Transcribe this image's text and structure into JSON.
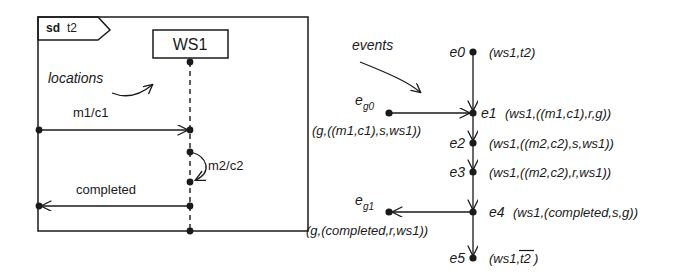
{
  "figure": {
    "left_panel": {
      "frame_kind": "sd",
      "frame_name": "t2",
      "lifeline_name": "WS1",
      "annotation": "locations",
      "messages": [
        {
          "label": "m1/c1",
          "kind": "incoming-arrow"
        },
        {
          "label": "m2/c2",
          "kind": "self-arrow"
        },
        {
          "label": "completed",
          "kind": "outgoing-arrow"
        }
      ]
    },
    "right_panel": {
      "annotation": "events",
      "events": [
        {
          "id": "e0",
          "sub": "",
          "value": "(ws1,t2)",
          "overline": ""
        },
        {
          "id": "e1",
          "sub": "",
          "value": "(ws1,((m1,c1),r,g))",
          "overline": ""
        },
        {
          "id": "e2",
          "sub": "",
          "value": "(ws1,((m2,c2),s,ws1))",
          "overline": ""
        },
        {
          "id": "e3",
          "sub": "",
          "value": "(ws1,((m2,c2),r,ws1))",
          "overline": ""
        },
        {
          "id": "e4",
          "sub": "",
          "value": "(ws1,(completed,s,g))",
          "overline": ""
        },
        {
          "id": "e5",
          "sub": "",
          "value_prefix": "(ws1,",
          "overline": "t2",
          "value_suffix": ")",
          "value": ""
        }
      ],
      "gate_events": [
        {
          "id": "e",
          "sub": "g0",
          "value": "(g,((m1,c1),s,ws1))"
        },
        {
          "id": "e",
          "sub": "g1",
          "value": "(g,(completed,r,ws1))"
        }
      ]
    },
    "colors": {
      "ink": "#1a1a1a",
      "background": "#ffffff"
    }
  }
}
